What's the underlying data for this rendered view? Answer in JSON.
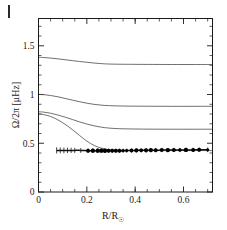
{
  "figure": {
    "corner_mark": "panel-label-tick",
    "background_color": "#ffffff",
    "curve_color": "#4a4a4a",
    "data_color": "#000000"
  },
  "axes": {
    "x": {
      "title_main": "R/R",
      "title_sub": "☉",
      "ticklabels": [
        "0",
        "0.2",
        "0.4",
        "0.6"
      ],
      "tickvalues": [
        0,
        0.2,
        0.4,
        0.6
      ],
      "min": 0,
      "max": 0.72,
      "minor_step": 0.05
    },
    "y": {
      "title": "Ω/2π  [μHz]",
      "ticklabels": [
        "0",
        "0.5",
        "1",
        "1.5"
      ],
      "tickvalues": [
        0,
        0.5,
        1.0,
        1.5
      ],
      "min": 0,
      "max": 1.78,
      "minor_step": 0.1
    }
  },
  "chart_data": {
    "type": "line",
    "title": "",
    "xlabel": "R/R☉",
    "ylabel": "Ω/2π [μHz]",
    "xlim": [
      0,
      0.72
    ],
    "ylim": [
      0,
      1.78
    ],
    "grid": false,
    "legend": "none",
    "series": [
      {
        "name": "model-curve-1",
        "style": "line",
        "x": [
          0.0,
          0.02,
          0.05,
          0.08,
          0.11,
          0.14,
          0.17,
          0.2,
          0.23,
          0.26,
          0.29,
          0.33,
          0.38,
          0.45,
          0.55,
          0.65,
          0.72
        ],
        "y": [
          1.382,
          1.38,
          1.374,
          1.366,
          1.357,
          1.348,
          1.339,
          1.331,
          1.323,
          1.317,
          1.313,
          1.311,
          1.31,
          1.309,
          1.308,
          1.308,
          1.308
        ]
      },
      {
        "name": "model-curve-2",
        "style": "line",
        "x": [
          0.0,
          0.02,
          0.05,
          0.08,
          0.11,
          0.14,
          0.17,
          0.2,
          0.23,
          0.26,
          0.29,
          0.33,
          0.38,
          0.45,
          0.55,
          0.65,
          0.72
        ],
        "y": [
          1.002,
          0.999,
          0.99,
          0.977,
          0.96,
          0.943,
          0.926,
          0.911,
          0.899,
          0.891,
          0.886,
          0.883,
          0.881,
          0.88,
          0.879,
          0.879,
          0.879
        ]
      },
      {
        "name": "model-curve-3",
        "style": "line",
        "x": [
          0.0,
          0.02,
          0.05,
          0.08,
          0.11,
          0.14,
          0.17,
          0.2,
          0.23,
          0.26,
          0.29,
          0.33,
          0.38,
          0.45,
          0.55,
          0.65,
          0.72
        ],
        "y": [
          0.823,
          0.82,
          0.808,
          0.79,
          0.768,
          0.744,
          0.719,
          0.697,
          0.679,
          0.665,
          0.656,
          0.65,
          0.647,
          0.645,
          0.644,
          0.644,
          0.644
        ]
      },
      {
        "name": "model-curve-4",
        "style": "line",
        "x": [
          0.0,
          0.02,
          0.05,
          0.08,
          0.11,
          0.14,
          0.17,
          0.2,
          0.23,
          0.26,
          0.29,
          0.33,
          0.38,
          0.45,
          0.55,
          0.65,
          0.72
        ],
        "y": [
          0.8,
          0.795,
          0.775,
          0.74,
          0.695,
          0.64,
          0.58,
          0.522,
          0.478,
          0.45,
          0.435,
          0.428,
          0.426,
          0.425,
          0.425,
          0.425,
          0.425
        ]
      },
      {
        "name": "inferred-rotation-rate",
        "style": "line-with-points-and-errorbars",
        "x": [
          0.075,
          0.09,
          0.105,
          0.12,
          0.135,
          0.15,
          0.175,
          0.205,
          0.225,
          0.245,
          0.26,
          0.275,
          0.29,
          0.305,
          0.32,
          0.335,
          0.35,
          0.365,
          0.385,
          0.405,
          0.425,
          0.445,
          0.465,
          0.485,
          0.51,
          0.535,
          0.56,
          0.585,
          0.61,
          0.64,
          0.665,
          0.7
        ],
        "y": [
          0.427,
          0.427,
          0.427,
          0.427,
          0.427,
          0.427,
          0.427,
          0.424,
          0.424,
          0.424,
          0.424,
          0.423,
          0.423,
          0.423,
          0.424,
          0.424,
          0.424,
          0.425,
          0.426,
          0.427,
          0.428,
          0.428,
          0.429,
          0.429,
          0.43,
          0.43,
          0.431,
          0.431,
          0.432,
          0.432,
          0.433,
          0.433
        ],
        "marker_sizes": [
          0,
          0,
          0,
          0,
          0,
          0,
          0,
          2.0,
          2.2,
          2.2,
          2.2,
          2.2,
          1.9,
          1.9,
          2.0,
          2.0,
          1.6,
          1.6,
          1.9,
          2.1,
          1.9,
          2.1,
          2.1,
          2.0,
          2.0,
          2.2,
          2.0,
          1.8,
          2.2,
          2.0,
          2.0,
          1.6
        ],
        "yerr": [
          0.032,
          0.03,
          0.029,
          0.028,
          0.027,
          0.026,
          0.025,
          0.024,
          0.023,
          0.023,
          0.022,
          0.022,
          0.022,
          0.021,
          0.021,
          0.021,
          0.021,
          0.021,
          0.021,
          0.021,
          0.021,
          0.021,
          0.021,
          0.021,
          0.021,
          0.021,
          0.021,
          0.022,
          0.022,
          0.022,
          0.023,
          0.024
        ]
      }
    ]
  }
}
